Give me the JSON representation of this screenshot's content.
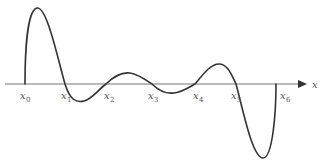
{
  "diagram": {
    "type": "function-graph",
    "axis": {
      "label": "x",
      "color": "#777777",
      "y": 84,
      "x_start": 5,
      "x_end": 305
    },
    "curve": {
      "color": "#333333",
      "description": "Oscillating curve starting at x0 rising to a tall peak, crossing the axis at x1..x5 with damped small oscillations, then a deep trough before ending at x6"
    },
    "points": [
      {
        "name": "x",
        "sub": "0",
        "px": 25
      },
      {
        "name": "x",
        "sub": "1",
        "px": 65
      },
      {
        "name": "x",
        "sub": "2",
        "px": 106
      },
      {
        "name": "x",
        "sub": "3",
        "px": 152
      },
      {
        "name": "x",
        "sub": "4",
        "px": 195
      },
      {
        "name": "x",
        "sub": "5",
        "px": 236
      },
      {
        "name": "x",
        "sub": "6",
        "px": 276
      }
    ]
  },
  "labels": {
    "axis": "x",
    "x0": "x",
    "x0_sub": "0",
    "x1": "x",
    "x1_sub": "1",
    "x2": "x",
    "x2_sub": "2",
    "x3": "x",
    "x3_sub": "3",
    "x4": "x",
    "x4_sub": "4",
    "x5": "x",
    "x5_sub": "5",
    "x6": "x",
    "x6_sub": "6"
  }
}
